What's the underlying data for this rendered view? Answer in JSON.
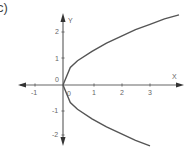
{
  "figure": {
    "label": "c)"
  },
  "chart_data": {
    "type": "line",
    "title": "",
    "xlabel": "X",
    "ylabel": "Y",
    "xlim": [
      -1.5,
      4.1
    ],
    "ylim": [
      -2.3,
      2.5
    ],
    "x_ticks": [
      "-1",
      "0",
      "1",
      "2",
      "3"
    ],
    "y_ticks": [
      "2",
      "1",
      "0",
      "-1",
      "-2"
    ],
    "origin_label": "0",
    "grid": false,
    "legend": null,
    "series": [
      {
        "name": "upper branch (sideways parabola)",
        "x": [
          0,
          0.25,
          0.5,
          1,
          1.5,
          2,
          2.5,
          3,
          3.5,
          4
        ],
        "y": [
          0,
          0.65,
          0.9,
          1.25,
          1.55,
          1.8,
          2.05,
          2.25,
          2.45,
          2.6
        ]
      },
      {
        "name": "lower branch (sideways parabola)",
        "x": [
          0,
          0.25,
          0.5,
          1,
          1.5,
          2,
          2.5,
          3
        ],
        "y": [
          0,
          -0.65,
          -0.9,
          -1.25,
          -1.55,
          -1.8,
          -2.05,
          -2.25
        ]
      }
    ],
    "colors": {
      "axis": "#555555",
      "curve": "#555555",
      "text": "#666666"
    }
  }
}
